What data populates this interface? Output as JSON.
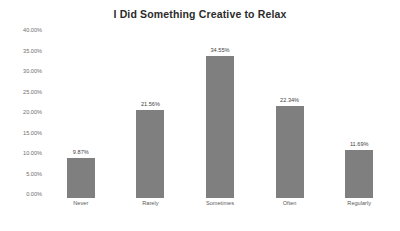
{
  "chart_data": {
    "type": "bar",
    "title": "I Did Something Creative to Relax",
    "categories": [
      "Never",
      "Rarely",
      "Sometimes",
      "Often",
      "Regularly"
    ],
    "values": [
      9.87,
      21.56,
      34.55,
      22.34,
      11.69
    ],
    "value_labels": [
      "9.87%",
      "21.56%",
      "34.55%",
      "22.34%",
      "11.69%"
    ],
    "xlabel": "",
    "ylabel": "",
    "ylim": [
      0,
      40
    ],
    "y_ticks": [
      0,
      5,
      10,
      15,
      20,
      25,
      30,
      35,
      40
    ],
    "y_tick_labels": [
      "0.00%",
      "5.00%",
      "10.00%",
      "15.00%",
      "20.00%",
      "25.00%",
      "30.00%",
      "35.00%",
      "40.00%"
    ],
    "grid": false,
    "legend": false,
    "legend_position": "none",
    "bar_color": "#7f7f7f",
    "title_color": "#2b2b2b",
    "background_color": "#ffffff"
  }
}
